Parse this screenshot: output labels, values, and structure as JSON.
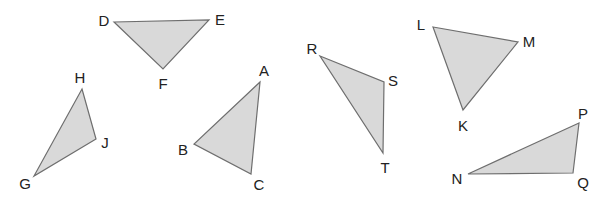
{
  "diagram": {
    "fill_color": "#d9d9d9",
    "stroke_color": "#6e6e6e",
    "label_color": "#222222",
    "triangles": [
      {
        "name": "DEF",
        "vertices": [
          {
            "label": "D",
            "x": 114,
            "y": 22,
            "lx": 104,
            "ly": 20
          },
          {
            "label": "E",
            "x": 209,
            "y": 20,
            "lx": 220,
            "ly": 19
          },
          {
            "label": "F",
            "x": 163,
            "y": 69,
            "lx": 163,
            "ly": 83
          }
        ]
      },
      {
        "name": "GHJ",
        "vertices": [
          {
            "label": "H",
            "x": 82,
            "y": 89,
            "lx": 80,
            "ly": 77
          },
          {
            "label": "J",
            "x": 96,
            "y": 139,
            "lx": 105,
            "ly": 142
          },
          {
            "label": "G",
            "x": 34,
            "y": 176,
            "lx": 25,
            "ly": 183
          }
        ]
      },
      {
        "name": "ABC",
        "vertices": [
          {
            "label": "A",
            "x": 260,
            "y": 82,
            "lx": 264,
            "ly": 70
          },
          {
            "label": "B",
            "x": 194,
            "y": 144,
            "lx": 183,
            "ly": 149
          },
          {
            "label": "C",
            "x": 251,
            "y": 174,
            "lx": 259,
            "ly": 184
          }
        ]
      },
      {
        "name": "RST",
        "vertices": [
          {
            "label": "R",
            "x": 320,
            "y": 56,
            "lx": 312,
            "ly": 48
          },
          {
            "label": "S",
            "x": 384,
            "y": 82,
            "lx": 393,
            "ly": 80
          },
          {
            "label": "T",
            "x": 383,
            "y": 153,
            "lx": 385,
            "ly": 167
          }
        ]
      },
      {
        "name": "KLM",
        "vertices": [
          {
            "label": "L",
            "x": 433,
            "y": 27,
            "lx": 421,
            "ly": 24
          },
          {
            "label": "M",
            "x": 518,
            "y": 42,
            "lx": 529,
            "ly": 41
          },
          {
            "label": "K",
            "x": 463,
            "y": 110,
            "lx": 463,
            "ly": 125
          }
        ]
      },
      {
        "name": "NPQ",
        "vertices": [
          {
            "label": "P",
            "x": 579,
            "y": 123,
            "lx": 583,
            "ly": 113
          },
          {
            "label": "N",
            "x": 468,
            "y": 174,
            "lx": 457,
            "ly": 178
          },
          {
            "label": "Q",
            "x": 573,
            "y": 173,
            "lx": 583,
            "ly": 182
          }
        ]
      }
    ]
  }
}
